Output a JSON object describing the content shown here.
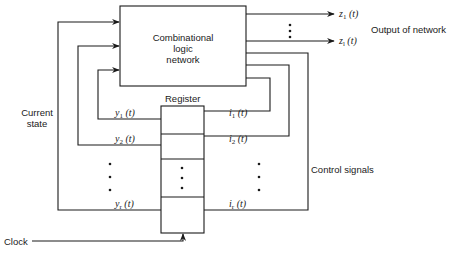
{
  "diagram": {
    "blocks": {
      "combinational": {
        "line1": "Combinational",
        "line2": "logic",
        "line3": "network"
      },
      "register": {
        "label": "Register",
        "dots": "⋮"
      }
    },
    "outputs": {
      "z1": {
        "var": "z",
        "sub": "1",
        "arg": " (t)"
      },
      "zl": {
        "var": "z",
        "sub": "l",
        "arg": " (t)"
      },
      "dots": "⋮",
      "label": "Output of network"
    },
    "state_signals": {
      "y1": {
        "var": "y",
        "sub": "1",
        "arg": " (t)"
      },
      "y2": {
        "var": "y",
        "sub": "2",
        "arg": " (t)"
      },
      "yr": {
        "var": "y",
        "sub": "r",
        "arg": " (t)"
      },
      "dots": "⋮",
      "label_line1": "Current",
      "label_line2": "state"
    },
    "control_signals": {
      "i1": {
        "var": "i",
        "sub": "1",
        "arg": " (t)"
      },
      "i2": {
        "var": "i",
        "sub": "2",
        "arg": " (t)"
      },
      "ir": {
        "var": "i",
        "sub": "r",
        "arg": " (t)"
      },
      "dots": "⋮",
      "label": "Control signals"
    },
    "clock": {
      "label": "Clock"
    },
    "colors": {
      "line": "#1a1a1a",
      "background": "#ffffff"
    }
  }
}
